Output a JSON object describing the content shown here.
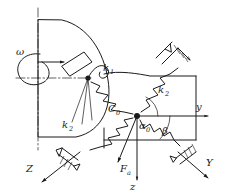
{
  "figure": {
    "type": "mechanical-schematic",
    "background_color": "#ffffff",
    "line_color": "#1a1a1a"
  },
  "labels": {
    "omega": "ω",
    "spring_k1": "k",
    "spring_k1_sub": "1",
    "spring_k2_right": "k",
    "spring_k2_right_sub": "2",
    "spring_k2_left": "k",
    "spring_k2_left_sub": "2",
    "center_node": "C",
    "center_node_sub": "0",
    "axis_y_lower": "y",
    "axis_z_lower": "z",
    "axis_Y_upper": "Y",
    "axis_Z_upper": "Z",
    "angle_alpha": "α",
    "angle_alpha_sub": "0",
    "angle_beta": "β",
    "force_Fa": "F",
    "force_Fa_sub": "a"
  },
  "elements": {
    "rotating_body": "hatched-circular-rotor",
    "contact_block": "hatched-contact-block",
    "ground_supports": [
      "upper-right-ground-hatch",
      "lower-left-ground-hatch",
      "lower-right-ground-hatch"
    ],
    "springs": [
      "k1-spring-upper",
      "k2-spring-upper-right",
      "k2-spring-lower-left",
      "k2-spring-lower-right"
    ],
    "center_mass_node": "C0-node",
    "rotor_contact_node": "contact-node"
  },
  "geometry": {
    "center_node_x": 137,
    "center_node_y": 116,
    "contact_node_x": 88,
    "contact_node_y": 78,
    "axis_y_end_x": 205,
    "axis_z_end_y": 178
  }
}
